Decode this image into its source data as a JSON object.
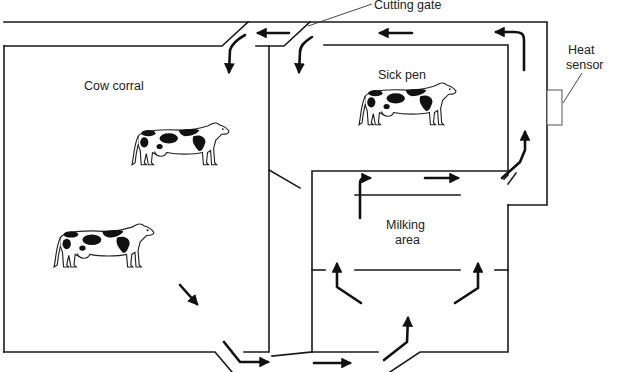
{
  "diagram": {
    "type": "dairy barn cow-flow layout",
    "labels": {
      "cutting_gate": "Cutting gate",
      "heat_sensor_line1": "Heat",
      "heat_sensor_line2": "sensor",
      "cow_corral": "Cow corral",
      "sick_pen": "Sick pen",
      "milking_area_line1": "Milking",
      "milking_area_line2": "area"
    },
    "regions": [
      {
        "name": "Cow corral",
        "cows": 2
      },
      {
        "name": "Sick pen",
        "cows": 1
      },
      {
        "name": "Milking area",
        "cows": 0
      }
    ],
    "components": [
      "Cutting gate",
      "Heat sensor"
    ],
    "flow": "Cows exit corral at bottom, move right into milking area, exit upward past heat sensor, then cutting gate routes cows either back to corral or into sick pen",
    "colors": {
      "line": "#1a1a1a",
      "background": "#ffffff",
      "text": "#222222"
    }
  }
}
